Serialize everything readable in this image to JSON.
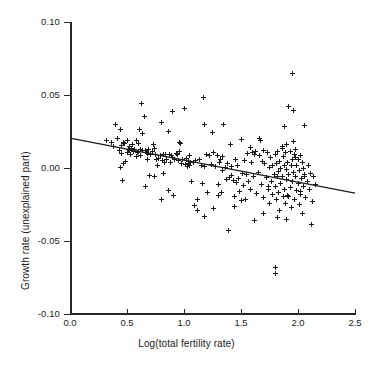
{
  "chart_data": {
    "type": "scatter",
    "title": "",
    "xlabel": "Log(total fertility rate)",
    "ylabel": "Growth rate (unexplained part)",
    "xlim": [
      0.0,
      2.5
    ],
    "ylim": [
      -0.1,
      0.1
    ],
    "xticks": [
      "0.0",
      "0.5",
      "1.0",
      "1.5",
      "2.0",
      "2.5"
    ],
    "xtick_values": [
      0.0,
      0.5,
      1.0,
      1.5,
      2.0,
      2.5
    ],
    "yticks": [
      "0.10",
      "0.05",
      "0.00",
      "-0.05",
      "-0.10"
    ],
    "ytick_values": [
      0.1,
      0.05,
      0.0,
      -0.05,
      -0.1
    ],
    "grid": false,
    "legend": "none",
    "marker": "plus-cross",
    "marker_color": "#1c1c1c",
    "axis_color": "#262626",
    "background": "#ffffff",
    "fit_line": {
      "label": "regression line",
      "color": "#1c1c1c",
      "x_start": 0.0,
      "y_start": 0.0205,
      "x_end": 2.5,
      "y_end": -0.0172,
      "slope": -0.0151,
      "intercept": 0.0205
    },
    "x": [
      0.32,
      0.36,
      0.38,
      0.4,
      0.42,
      0.43,
      0.44,
      0.45,
      0.45,
      0.46,
      0.47,
      0.47,
      0.48,
      0.49,
      0.5,
      0.5,
      0.51,
      0.52,
      0.53,
      0.54,
      0.55,
      0.56,
      0.57,
      0.58,
      0.58,
      0.59,
      0.6,
      0.61,
      0.62,
      0.62,
      0.63,
      0.64,
      0.65,
      0.66,
      0.66,
      0.67,
      0.68,
      0.69,
      0.7,
      0.71,
      0.72,
      0.73,
      0.74,
      0.75,
      0.76,
      0.77,
      0.78,
      0.79,
      0.8,
      0.81,
      0.82,
      0.83,
      0.84,
      0.85,
      0.86,
      0.87,
      0.88,
      0.89,
      0.9,
      0.91,
      0.92,
      0.93,
      0.94,
      0.95,
      0.96,
      0.97,
      0.98,
      0.99,
      1.0,
      1.01,
      1.02,
      1.03,
      1.04,
      1.05,
      1.05,
      1.06,
      1.07,
      1.08,
      1.09,
      1.1,
      1.12,
      1.14,
      1.15,
      1.16,
      1.17,
      1.18,
      1.2,
      1.21,
      1.22,
      1.24,
      1.25,
      1.26,
      1.28,
      1.29,
      1.3,
      1.31,
      1.32,
      1.33,
      1.34,
      1.35,
      1.36,
      1.37,
      1.38,
      1.39,
      1.4,
      1.41,
      1.42,
      1.43,
      1.44,
      1.45,
      1.46,
      1.47,
      1.48,
      1.49,
      1.5,
      1.51,
      1.52,
      1.53,
      1.54,
      1.55,
      1.56,
      1.57,
      1.58,
      1.59,
      1.6,
      1.61,
      1.62,
      1.63,
      1.64,
      1.65,
      1.66,
      1.67,
      1.68,
      1.69,
      1.7,
      1.7,
      1.71,
      1.72,
      1.73,
      1.74,
      1.75,
      1.75,
      1.76,
      1.77,
      1.78,
      1.78,
      1.79,
      1.8,
      1.8,
      1.81,
      1.81,
      1.82,
      1.82,
      1.83,
      1.83,
      1.84,
      1.84,
      1.85,
      1.85,
      1.86,
      1.86,
      1.87,
      1.87,
      1.88,
      1.88,
      1.89,
      1.89,
      1.9,
      1.9,
      1.9,
      1.91,
      1.91,
      1.92,
      1.92,
      1.93,
      1.93,
      1.94,
      1.94,
      1.95,
      1.95,
      1.96,
      1.96,
      1.97,
      1.97,
      1.98,
      1.98,
      1.99,
      1.99,
      2.0,
      2.0,
      2.01,
      2.01,
      2.02,
      2.02,
      2.03,
      2.04,
      2.04,
      2.05,
      2.05,
      2.06,
      2.06,
      2.07,
      2.08,
      2.09,
      2.1,
      2.11,
      2.12,
      2.13,
      2.14,
      2.15,
      0.44,
      0.52,
      0.6,
      0.64,
      0.68,
      0.74,
      0.82,
      0.9,
      0.96,
      1.04,
      1.1,
      1.18,
      1.26,
      1.34,
      1.42,
      1.5,
      1.58,
      1.66,
      1.74,
      1.82,
      1.86,
      1.92,
      1.98,
      2.02,
      1.8,
      1.8,
      1.95,
      1.18,
      0.64,
      0.8,
      1.88,
      1.96,
      2.06,
      1.9,
      1.7,
      1.62,
      1.44,
      1.3,
      1.12,
      0.86
    ],
    "y": [
      0.0185,
      0.0175,
      0.015,
      0.03,
      0.0205,
      0.012,
      0.0005,
      0.0155,
      0.01,
      -0.0085,
      0.0175,
      0.003,
      0.0165,
      0.0045,
      0.0185,
      0.0105,
      0.013,
      0.012,
      0.0095,
      0.0135,
      0.016,
      0.011,
      0.0125,
      0.008,
      0.0185,
      0.0105,
      0.0115,
      0.0265,
      0.013,
      0.0085,
      0.044,
      0.012,
      0.0355,
      0.012,
      -0.013,
      0.0105,
      0.01,
      0.0125,
      -0.005,
      0.009,
      0.0115,
      0.016,
      -0.006,
      0.0095,
      0.0055,
      0.002,
      0.0065,
      0.0085,
      0.031,
      0.005,
      -0.004,
      0.0035,
      0.0095,
      0.006,
      0.025,
      0.0095,
      0.0035,
      0.0085,
      0.039,
      -0.0185,
      0.006,
      0.01,
      0.009,
      0.005,
      0.0175,
      0.017,
      0.003,
      0.0055,
      0.041,
      0.0025,
      0.0065,
      0.001,
      0.0045,
      0.0085,
      0.0015,
      0.0035,
      -0.0095,
      0.004,
      -0.0255,
      0.005,
      -0.029,
      0.006,
      0.002,
      -0.0105,
      0.048,
      0.001,
      0.009,
      -0.0165,
      0.0085,
      0.0025,
      0.024,
      0.0105,
      0.001,
      0.0085,
      -0.0115,
      0.004,
      0.0055,
      -0.0165,
      -0.002,
      0.0295,
      0.0005,
      -0.008,
      0.003,
      -0.043,
      -0.0065,
      0.016,
      0.001,
      -0.0085,
      -0.0195,
      0.006,
      -0.01,
      0.002,
      -0.0075,
      -0.016,
      0.0195,
      -0.0035,
      -0.012,
      0.005,
      -0.0215,
      -0.0045,
      0.01,
      -0.009,
      -0.0145,
      0.0035,
      0.0105,
      -0.0055,
      -0.036,
      0.0115,
      -0.0175,
      -0.003,
      0.0085,
      0.019,
      -0.011,
      0.0045,
      0.012,
      -0.02,
      0.003,
      -0.0065,
      0.0105,
      -0.015,
      0.0005,
      -0.024,
      0.007,
      -0.0095,
      0.0015,
      -0.018,
      -0.0045,
      0.009,
      -0.013,
      0.003,
      -0.0215,
      -0.006,
      0.011,
      -0.0025,
      -0.0165,
      0.0045,
      -0.029,
      0.0,
      -0.0105,
      0.0135,
      -0.0055,
      0.008,
      -0.0195,
      0.002,
      -0.0145,
      0.0105,
      -0.0245,
      -0.001,
      0.016,
      -0.008,
      0.004,
      -0.0185,
      0.042,
      -0.0045,
      0.0115,
      -0.0135,
      0.0015,
      -0.027,
      0.006,
      -0.0095,
      0.0395,
      -0.003,
      0.009,
      -0.0215,
      -0.006,
      0.013,
      -0.0155,
      0.002,
      -0.0105,
      0.006,
      -0.025,
      -0.002,
      0.0085,
      -0.018,
      -0.007,
      0.004,
      -0.031,
      0.0,
      -0.0125,
      -0.0055,
      0.029,
      -0.02,
      -0.009,
      0.002,
      -0.0145,
      -0.0035,
      -0.039,
      -0.023,
      -0.006,
      -0.011,
      0.0265,
      0.0145,
      0.0165,
      0.0235,
      0.0055,
      0.0135,
      0.0095,
      0.007,
      0.0115,
      0.003,
      0.005,
      0.03,
      -0.0275,
      0.008,
      -0.005,
      -0.0225,
      0.014,
      0.02,
      -0.0125,
      -0.034,
      0.0145,
      -0.0195,
      0.007,
      -0.016,
      -0.068,
      -0.072,
      0.0645,
      -0.033,
      0.012,
      -0.0215,
      0.0285,
      0.018,
      -0.0045,
      -0.035,
      -0.031,
      0.009,
      -0.0265,
      -0.0185,
      -0.0215,
      -0.0155
    ]
  }
}
